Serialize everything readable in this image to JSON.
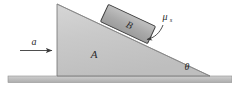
{
  "figure": {
    "background_color": "#ffffff",
    "labels": {
      "wedge": "A",
      "block": "B",
      "acceleration": "a",
      "angle": "θ",
      "friction_symbol": "μ",
      "friction_subscript": "s"
    },
    "colors": {
      "wedge_fill": "#c6c6c6",
      "wedge_fill_light": "#d2d2d2",
      "wedge_edge": "#6e6e6e",
      "block_fill": "#a9a9a9",
      "block_fill_light": "#bdbdbd",
      "block_edge": "#3a3a3a",
      "ground_fill": "#bdbdbd",
      "ground_edge": "#8a8a8a",
      "line_color": "#3a3a3a",
      "text_color": "#2b2b2b"
    },
    "geometry": {
      "wedge_apex": [
        57,
        4
      ],
      "wedge_bottom_left": [
        57,
        76
      ],
      "wedge_bottom_right": [
        210,
        76
      ],
      "incline_angle_degrees": 25,
      "ground_left": [
        8,
        76
      ],
      "ground_right": [
        232,
        76
      ],
      "ground_thickness": 6,
      "block_center": [
        128,
        24
      ],
      "block_width": 52,
      "block_height": 19,
      "block_rotation_degrees": 25,
      "arrow_start": [
        20,
        50
      ],
      "arrow_end": [
        53,
        50
      ],
      "arrow_label_pos": [
        34,
        43
      ],
      "angle_label_pos": [
        186,
        68
      ],
      "friction_label_pos": [
        167,
        18
      ],
      "leader_from": [
        160,
        24
      ],
      "leader_to": [
        145,
        38
      ]
    },
    "icon_names": {
      "acceleration_arrow": "right-arrow-icon",
      "friction_leader": "curved-leader-arrow-icon"
    }
  }
}
